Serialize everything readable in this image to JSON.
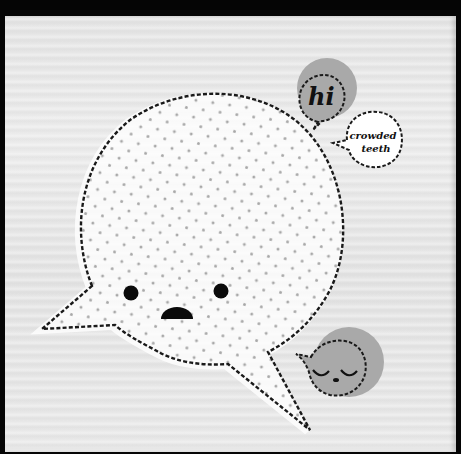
{
  "scene": {
    "description": "Illustration of speech bubbles on light wood-grain background",
    "background_color": "#e6e6e6",
    "frame_color": "#050505"
  },
  "main_bubble": {
    "fill": "#ffffff",
    "dot_color": "#a8a8a8",
    "outline_color": "#1a1a1a",
    "face": {
      "left_eye": "eye",
      "right_eye": "eye",
      "mouth": "frown-semicircle"
    }
  },
  "hi_bubble": {
    "text": "hi",
    "fill": "#a9a9a9"
  },
  "crowded_bubble": {
    "line1": "crowded",
    "line2": "teeth"
  },
  "sleepy_bubble": {
    "fill": "#a9a9a9",
    "face": "sleeping-face"
  }
}
